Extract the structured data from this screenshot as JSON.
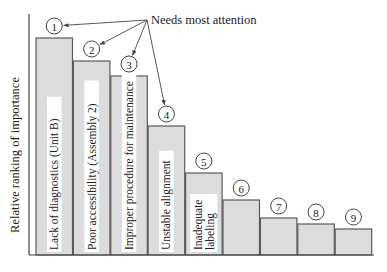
{
  "chart_data": {
    "type": "bar",
    "title": "",
    "subtitle": "",
    "xlabel": "",
    "ylabel": "Relative ranking of importance",
    "grid": false,
    "legend": null,
    "chart_kind": "pareto",
    "categories": [
      "Lack of diagnostics (Unit B)",
      "Poor accessibility (Assembly 2)",
      "Improper procedure for maintenance",
      "Unstable alignment",
      "Inadequate labeling",
      "",
      "",
      "",
      ""
    ],
    "ranks": [
      "1",
      "2",
      "3",
      "4",
      "5",
      "6",
      "7",
      "8",
      "9"
    ],
    "values": [
      217,
      194,
      179,
      129,
      82,
      55,
      37,
      31,
      26
    ],
    "value_units": "relative height (px, axis unlabeled)",
    "annotation": {
      "text": "Needs most attention",
      "points_to_ranks": [
        "1",
        "2",
        "3",
        "4"
      ]
    }
  },
  "colors": {
    "bar_fill": "#dcdcdc",
    "bar_stroke": "#5a5a5a",
    "axis": "#444444",
    "text": "#222222"
  }
}
